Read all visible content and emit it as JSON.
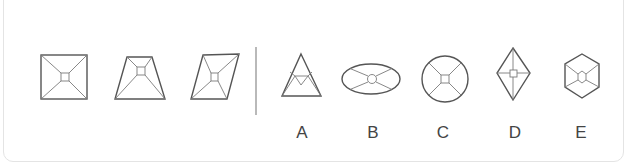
{
  "puzzle": {
    "type": "figure-reasoning",
    "question_figures": [
      {
        "name": "square-with-inner-square",
        "outer": "square",
        "inner": "square"
      },
      {
        "name": "trapezoid-with-inner-square",
        "outer": "trapezoid",
        "inner": "square"
      },
      {
        "name": "parallelogram-with-inner-square",
        "outer": "parallelogram",
        "inner": "square"
      }
    ],
    "options": [
      {
        "label": "A",
        "outer": "triangle",
        "inner": "inverted-triangle"
      },
      {
        "label": "B",
        "outer": "ellipse",
        "inner": "circle"
      },
      {
        "label": "C",
        "outer": "circle",
        "inner": "square"
      },
      {
        "label": "D",
        "outer": "rhombus",
        "inner": "square"
      },
      {
        "label": "E",
        "outer": "hexagon",
        "inner": "hexagon"
      }
    ]
  },
  "colors": {
    "stroke": "#555555",
    "inner_stroke": "#7a7a7a",
    "label": "#444444",
    "frame": "#e4e4e4",
    "background": "#ffffff"
  }
}
